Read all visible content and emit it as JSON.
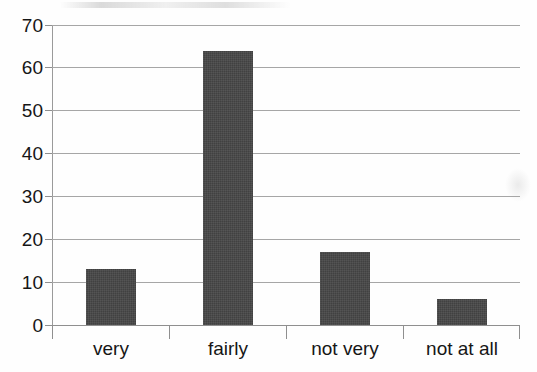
{
  "chart_data": {
    "type": "bar",
    "title": "",
    "subtitle": "",
    "xlabel": "",
    "ylabel": "",
    "categories": [
      "very",
      "fairly",
      "not very",
      "not at all"
    ],
    "values": [
      13,
      64,
      17,
      6
    ],
    "series": [
      {
        "name": "",
        "values": [
          13,
          64,
          17,
          6
        ]
      }
    ],
    "ylim": [
      0,
      70
    ],
    "ytick_step": 10,
    "yticks": [
      0,
      10,
      20,
      30,
      40,
      50,
      60,
      70
    ],
    "ytick_labels": [
      "0",
      "10",
      "20",
      "30",
      "40",
      "50",
      "60",
      "70"
    ],
    "grid": true,
    "grid_axis": "y",
    "legend": false,
    "legend_position": "none",
    "bar_color": "#414141",
    "gridline_color": "#a6a6a6",
    "axis_color": "#8f8f8f",
    "background_color": "#ffffff",
    "text_color": "#161616",
    "annotations": []
  }
}
